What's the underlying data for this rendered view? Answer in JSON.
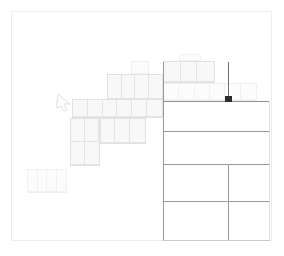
{
  "app": {
    "title": "Spreadsheet Canvas",
    "background_color": "#ffffff",
    "frame_color": "#ededed",
    "cell_fill": "#fbfbfb",
    "cell_border": "#ececec",
    "table_line_color": "#9a9a9a",
    "rule_color": "#8f8f8f",
    "marker_color": "#2b2b2b",
    "guide_color": "#6f6f6f"
  },
  "canvas": {
    "label": "drawing-canvas",
    "width": 284,
    "height": 256
  },
  "blocks": [
    {
      "name": "block-top-rounded-tab",
      "label": "",
      "x": 179,
      "y": 54,
      "w": 22,
      "h": 8,
      "cols": 1,
      "rows": 1
    },
    {
      "name": "block-top-band-right",
      "label": "",
      "x": 163,
      "y": 61,
      "w": 52,
      "h": 22,
      "cols": 3,
      "rows": 1
    },
    {
      "name": "block-small-floater",
      "label": "",
      "x": 131,
      "y": 61,
      "w": 18,
      "h": 14,
      "cols": 1,
      "rows": 1
    },
    {
      "name": "block-mid-upper",
      "label": "",
      "x": 107,
      "y": 74,
      "w": 56,
      "h": 26,
      "cols": 4,
      "rows": 1
    },
    {
      "name": "block-top-right-row",
      "label": "",
      "x": 163,
      "y": 83,
      "w": 94,
      "h": 18,
      "cols": 6,
      "rows": 1
    },
    {
      "name": "block-mid-row",
      "label": "",
      "x": 72,
      "y": 99,
      "w": 91,
      "h": 19,
      "cols": 6,
      "rows": 1
    },
    {
      "name": "block-lower-row",
      "label": "",
      "x": 70,
      "y": 118,
      "w": 76,
      "h": 26,
      "cols": 5,
      "rows": 1
    },
    {
      "name": "block-left-column",
      "label": "",
      "x": 70,
      "y": 118,
      "w": 30,
      "h": 48,
      "cols": 2,
      "rows": 2
    },
    {
      "name": "block-corner-box",
      "label": "",
      "x": 27,
      "y": 169,
      "w": 40,
      "h": 24,
      "cols": 4,
      "rows": 1
    }
  ],
  "table": {
    "name": "data-table-grid",
    "left": 163,
    "right": 270,
    "rows": [
      {
        "name": "table-row",
        "y": 101
      },
      {
        "name": "table-row",
        "y": 131
      },
      {
        "name": "table-row",
        "y": 164
      },
      {
        "name": "table-row",
        "y": 201
      },
      {
        "name": "table-row",
        "y": 240
      }
    ],
    "column_split_x": 228,
    "column_split_top": 164,
    "column_split_bottom": 240
  },
  "selection": {
    "name": "selected-cell-marker",
    "x": 225,
    "y": 96,
    "w": 7,
    "h": 6,
    "guide_x": 228,
    "guide_top": 62,
    "guide_bottom": 101
  },
  "cursor": {
    "name": "mouse-cursor",
    "x": 56,
    "y": 94,
    "points": "0,14 2,0 14,10 8,10 11,16 8,17 5,12"
  },
  "rules": [
    {
      "name": "header-rule",
      "x": 163,
      "y": 101,
      "w": 107
    }
  ]
}
